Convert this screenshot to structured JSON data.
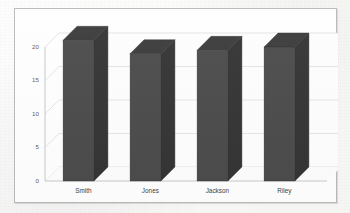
{
  "chart_data": {
    "type": "bar",
    "title": "",
    "subtitle": "",
    "xlabel": "",
    "ylabel": "",
    "categories": [
      "Smith",
      "Jones",
      "Jackson",
      "Riley"
    ],
    "values": [
      21,
      19,
      19.5,
      20
    ],
    "ylim": [
      0,
      20
    ],
    "yticks": [
      0,
      5,
      10,
      15,
      20
    ],
    "ytick_labels": [
      "0",
      "5",
      "10",
      "15",
      "20"
    ],
    "grid": true,
    "grid_axis": "y",
    "legend": false,
    "legend_position": "none",
    "style": "3d-column",
    "colors": {
      "bar_front": "#4a4a4a",
      "bar_top": "#3a3a3a",
      "bar_side": "#333333",
      "grid_line": "#d8d8d8",
      "axis_line": "#c2c2c2",
      "frame_border": "#b9b9b9",
      "plot_background": "#fefefe",
      "tick_text": "#5b5b5b",
      "category_text": "#3f3f3f"
    }
  },
  "figure": {
    "frame_label": "chart-frame",
    "background_label": "scanned-page"
  }
}
